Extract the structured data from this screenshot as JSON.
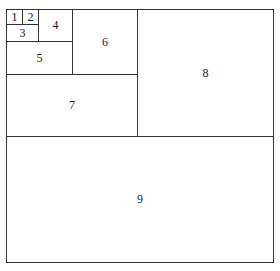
{
  "diagram": {
    "title": "",
    "cells": [
      {
        "label": "1",
        "x": 6,
        "y": 9,
        "w": 17,
        "h": 16
      },
      {
        "label": "2",
        "x": 22,
        "y": 9,
        "w": 17,
        "h": 16
      },
      {
        "label": "3",
        "x": 6,
        "y": 24,
        "w": 33,
        "h": 18
      },
      {
        "label": "4",
        "x": 38,
        "y": 9,
        "w": 35,
        "h": 33
      },
      {
        "label": "5",
        "x": 6,
        "y": 41,
        "w": 67,
        "h": 34
      },
      {
        "label": "6",
        "x": 72,
        "y": 9,
        "w": 66,
        "h": 66
      },
      {
        "label": "7",
        "x": 6,
        "y": 74,
        "w": 132,
        "h": 63
      },
      {
        "label": "8",
        "x": 137,
        "y": 9,
        "w": 137,
        "h": 128
      },
      {
        "label": "9",
        "x": 6,
        "y": 136,
        "w": 268,
        "h": 127
      }
    ]
  }
}
